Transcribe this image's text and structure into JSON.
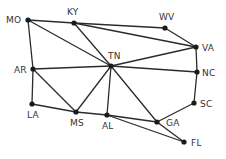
{
  "diagram": {
    "type": "graph",
    "style": {
      "edge_color": "#2b2b2b",
      "node_color": "#1a1a1a",
      "label_color": "#333333",
      "background": "#ffffff"
    },
    "nodes": [
      {
        "id": "MO",
        "label": "MO",
        "x": 28,
        "y": 20,
        "lx": 6,
        "ly": 23
      },
      {
        "id": "KY",
        "label": "KY",
        "x": 74,
        "y": 23,
        "lx": 67,
        "ly": 15
      },
      {
        "id": "WV",
        "label": "WV",
        "x": 165,
        "y": 28,
        "lx": 159,
        "ly": 20
      },
      {
        "id": "VA",
        "label": "VA",
        "x": 196,
        "y": 47,
        "lx": 202,
        "ly": 51
      },
      {
        "id": "TN",
        "label": "TN",
        "x": 111,
        "y": 66,
        "lx": 108,
        "ly": 59
      },
      {
        "id": "AR",
        "label": "AR",
        "x": 33,
        "y": 69,
        "lx": 14,
        "ly": 73
      },
      {
        "id": "NC",
        "label": "NC",
        "x": 197,
        "y": 72,
        "lx": 202,
        "ly": 76
      },
      {
        "id": "SC",
        "label": "SC",
        "x": 194,
        "y": 103,
        "lx": 200,
        "ly": 107
      },
      {
        "id": "LA",
        "label": "LA",
        "x": 32,
        "y": 104,
        "lx": 27,
        "ly": 118
      },
      {
        "id": "MS",
        "label": "MS",
        "x": 76,
        "y": 112,
        "lx": 70,
        "ly": 126
      },
      {
        "id": "AL",
        "label": "AL",
        "x": 107,
        "y": 115,
        "lx": 102,
        "ly": 129
      },
      {
        "id": "GA",
        "label": "GA",
        "x": 157,
        "y": 122,
        "lx": 166,
        "ly": 126
      },
      {
        "id": "FL",
        "label": "FL",
        "x": 184,
        "y": 142,
        "lx": 191,
        "ly": 146
      }
    ],
    "edges": [
      [
        "MO",
        "KY"
      ],
      [
        "MO",
        "TN"
      ],
      [
        "MO",
        "AR"
      ],
      [
        "KY",
        "WV"
      ],
      [
        "KY",
        "VA"
      ],
      [
        "KY",
        "TN"
      ],
      [
        "WV",
        "VA"
      ],
      [
        "VA",
        "TN"
      ],
      [
        "VA",
        "NC"
      ],
      [
        "TN",
        "AR"
      ],
      [
        "TN",
        "NC"
      ],
      [
        "TN",
        "MS"
      ],
      [
        "TN",
        "AL"
      ],
      [
        "TN",
        "GA"
      ],
      [
        "AR",
        "LA"
      ],
      [
        "AR",
        "MS"
      ],
      [
        "LA",
        "MS"
      ],
      [
        "MS",
        "AL"
      ],
      [
        "AL",
        "GA"
      ],
      [
        "AL",
        "FL"
      ],
      [
        "GA",
        "FL"
      ],
      [
        "GA",
        "SC"
      ],
      [
        "SC",
        "NC"
      ]
    ]
  }
}
